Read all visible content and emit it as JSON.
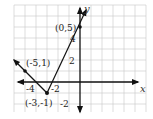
{
  "graph": {
    "title": "",
    "function": "absolute value V-shape",
    "axes": {
      "x_label": "x",
      "y_label": "y",
      "x_ticks": [
        {
          "value": -4,
          "label": "-4"
        },
        {
          "value": -2,
          "label": "-2"
        }
      ],
      "y_ticks": [
        {
          "value": 2,
          "label": "2"
        },
        {
          "value": 4,
          "label": "4"
        },
        {
          "value": -2,
          "label": "-2"
        }
      ]
    },
    "points": [
      {
        "x": 0,
        "y": 5,
        "label": "(0,5)"
      },
      {
        "x": -5,
        "y": 1,
        "label": "(-5,1)"
      },
      {
        "x": -3,
        "y": -1,
        "label": "(-3,-1)"
      }
    ],
    "grid": true,
    "colors": {
      "line": "#222222",
      "grid": "#c8c8c8",
      "axis": "#111111"
    }
  }
}
